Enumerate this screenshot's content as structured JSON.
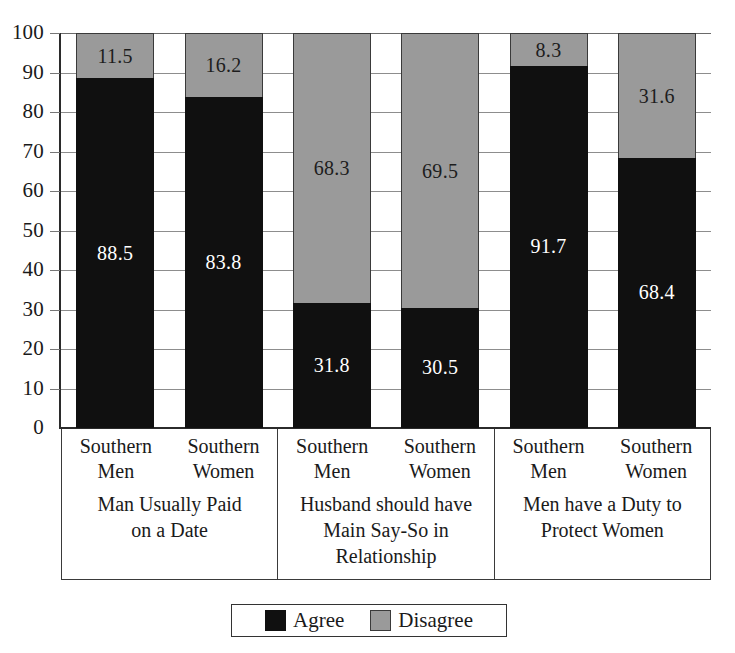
{
  "chart_data": {
    "type": "bar",
    "subtype": "stacked-bar-100",
    "title": "",
    "xlabel": "",
    "ylabel": "",
    "ylim": [
      0,
      100
    ],
    "ytick_step": 10,
    "yticks": [
      100,
      90,
      80,
      70,
      60,
      50,
      40,
      30,
      20,
      10,
      0
    ],
    "grid": true,
    "legend_position": "bottom-center",
    "categories": [
      "Southern Men",
      "Southern Women",
      "Southern Men",
      "Southern Women",
      "Southern Men",
      "Southern Women"
    ],
    "groups": [
      {
        "title": "Man Usually Paid on a Date",
        "title_lines": [
          "Man Usually Paid",
          "on a Date"
        ],
        "bars": [
          {
            "category_lines": [
              "Southern",
              "Men"
            ],
            "agree": 88.5,
            "disagree": 11.5
          },
          {
            "category_lines": [
              "Southern",
              "Women"
            ],
            "agree": 83.8,
            "disagree": 16.2
          }
        ]
      },
      {
        "title": "Husband should have Main Say-So in Relationship",
        "title_lines": [
          "Husband should have",
          "Main Say-So in",
          "Relationship"
        ],
        "bars": [
          {
            "category_lines": [
              "Southern",
              "Men"
            ],
            "agree": 31.8,
            "disagree": 68.3
          },
          {
            "category_lines": [
              "Southern",
              "Women"
            ],
            "agree": 30.5,
            "disagree": 69.5
          }
        ]
      },
      {
        "title": "Men have a Duty to Protect Women",
        "title_lines": [
          "Men have a Duty to",
          "Protect Women"
        ],
        "bars": [
          {
            "category_lines": [
              "Southern",
              "Men"
            ],
            "agree": 91.7,
            "disagree": 8.3
          },
          {
            "category_lines": [
              "Southern",
              "Women"
            ],
            "agree": 68.4,
            "disagree": 31.6
          }
        ]
      }
    ],
    "series": [
      {
        "name": "Agree",
        "color": "#101010",
        "values": [
          88.5,
          83.8,
          31.8,
          30.5,
          91.7,
          68.4
        ]
      },
      {
        "name": "Disagree",
        "color": "#9a9a9a",
        "values": [
          11.5,
          16.2,
          68.3,
          69.5,
          8.3,
          31.6
        ]
      }
    ],
    "value_labels": {
      "agree": [
        "88.5",
        "83.8",
        "31.8",
        "30.5",
        "91.7",
        "68.4"
      ],
      "disagree": [
        "11.5",
        "16.2",
        "68.3",
        "69.5",
        "8.3",
        "31.6"
      ]
    }
  },
  "legend": {
    "items": [
      {
        "label": "Agree",
        "color": "#101010"
      },
      {
        "label": "Disagree",
        "color": "#9a9a9a"
      }
    ]
  },
  "colors": {
    "agree": "#101010",
    "disagree": "#9a9a9a",
    "axis": "#2b2b2b",
    "grid": "#8d8d8d",
    "background": "#ffffff"
  }
}
